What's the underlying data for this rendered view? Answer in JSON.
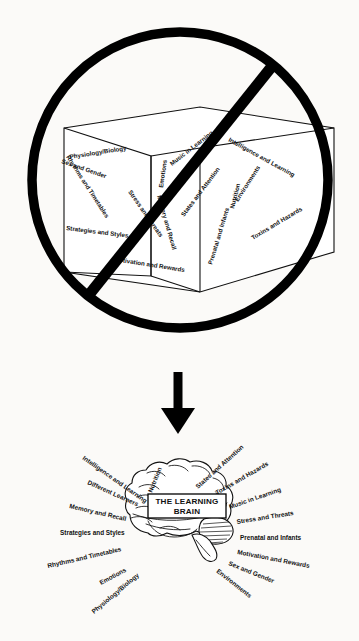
{
  "figure": {
    "name": "learning-brain-concept-figure",
    "top_panel": {
      "name": "crossed-out-box-panel",
      "prohibition_symbol": "no-entry-circle-slash",
      "caption_inside": "open box containing learning topics",
      "labels": [
        "Physiology/Biology",
        "Emotions",
        "Music in Learning",
        "Intelligence and Learning",
        "Sex and Gender",
        "Rhythms and Timetables",
        "Stress and Threats",
        "Memory and Recall",
        "States and Attention",
        "Environments",
        "Nutrition",
        "Prenatal and Infants",
        "Toxins and Hazards",
        "Strategies and Styles",
        "Motivation and Rewards"
      ]
    },
    "connector": {
      "name": "downward-arrow",
      "direction": "down"
    },
    "bottom_panel": {
      "name": "learning-brain-radial-panel",
      "center_label_line1": "THE LEARNING",
      "center_label_line2": "BRAIN",
      "left_labels": [
        "Intelligence and Learning",
        "Different Learners",
        "Memory and Recall",
        "Strategies and Styles",
        "Rhythms and Timetables",
        "Emotions",
        "Physiology/Biology"
      ],
      "top_label": "Nutrition",
      "right_labels": [
        "States and Attention",
        "Toxins and Hazards",
        "Music in Learning",
        "Stress and Threats",
        "Prenatal and Infants",
        "Motivation and Rewards",
        "Sex and Gender",
        "Environments"
      ]
    },
    "colors": {
      "ink": "#111111",
      "paper": "#fbfaf8",
      "symbol": "#000000"
    }
  }
}
